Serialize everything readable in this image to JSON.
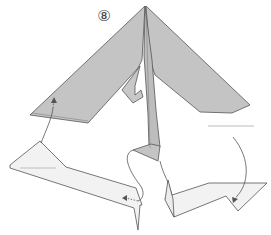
{
  "diagram": {
    "step_number": "⑧",
    "colors": {
      "paper_colored": "#c4c4c4",
      "paper_white": "#f2f2f2",
      "outline": "#555555",
      "arrow": "#555555",
      "background": "#ffffff"
    },
    "elements": [
      "main-folded-model",
      "left-flap-before",
      "right-flap-before",
      "center-flap",
      "fold-arrow-left",
      "fold-arrow-center",
      "fold-arrow-right"
    ]
  }
}
